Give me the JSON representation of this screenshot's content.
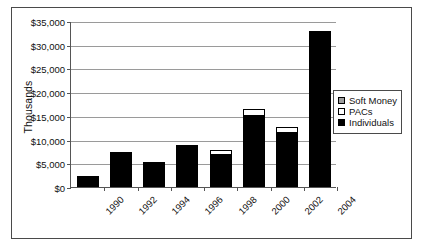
{
  "chart_data": {
    "type": "bar",
    "stacked": true,
    "title": "",
    "subtitle": "",
    "xlabel": "",
    "ylabel": "Thousands",
    "categories": [
      "1990",
      "1992",
      "1994",
      "1996",
      "1998",
      "2000",
      "2002",
      "2004"
    ],
    "series": [
      {
        "name": "Individuals",
        "values": [
          1900,
          6950,
          4900,
          8400,
          6650,
          14900,
          11450,
          32400
        ]
      },
      {
        "name": "PACs",
        "values": [
          300,
          100,
          100,
          150,
          1150,
          1600,
          1250,
          200
        ]
      },
      {
        "name": "Soft Money",
        "values": [
          0,
          0,
          0,
          0,
          0,
          0,
          0,
          0
        ]
      }
    ],
    "ylim": [
      0,
      35000
    ],
    "ytick_values": [
      0,
      5000,
      10000,
      15000,
      20000,
      25000,
      30000,
      35000
    ],
    "ytick_labels": [
      "$0",
      "$5,000",
      "$10,000",
      "$15,000",
      "$20,000",
      "$25,000",
      "$30,000",
      "$35,000"
    ],
    "grid": true,
    "grid_axis": "y",
    "legend_position": "right",
    "xtick_rotation": -45,
    "colors": {
      "soft_money": "#9e9e9e",
      "pacs": "#ffffff",
      "individuals": "#000000",
      "gridline": "#9a9a9a",
      "axis": "#555555",
      "frame": "#4a4a4a",
      "text": "#111111",
      "background": "#ffffff"
    }
  },
  "legend": {
    "items": [
      {
        "label": "Soft Money",
        "swatch": "soft-money-swatch"
      },
      {
        "label": "PACs",
        "swatch": "pacs-swatch"
      },
      {
        "label": "Individuals",
        "swatch": "individuals-swatch"
      }
    ]
  }
}
